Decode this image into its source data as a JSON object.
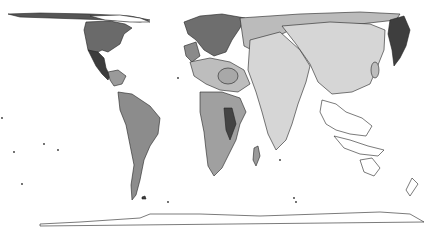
{
  "map": {
    "type": "cartogram",
    "style": "grayscale",
    "background": "#ffffff",
    "outline_color": "#222222",
    "shades": {
      "lightest": "#dcdcdc",
      "light": "#c4c4c4",
      "medium": "#a8a8a8",
      "mediumdark": "#8c8c8c",
      "dark": "#707070",
      "darkest": "#3c3c3c",
      "empty": "#ffffff"
    },
    "regions": [
      {
        "name": "north-america",
        "shade": "dark"
      },
      {
        "name": "mexico-central-america",
        "shade": "darkest"
      },
      {
        "name": "caribbean",
        "shade": "medium"
      },
      {
        "name": "south-america",
        "shade": "mediumdark"
      },
      {
        "name": "greenland-arctic",
        "shade": "darkest"
      },
      {
        "name": "europe",
        "shade": "dark"
      },
      {
        "name": "north-africa-middle-east",
        "shade": "light"
      },
      {
        "name": "sub-saharan-africa",
        "shade": "medium"
      },
      {
        "name": "russia-central-asia",
        "shade": "light"
      },
      {
        "name": "south-asia",
        "shade": "lightest"
      },
      {
        "name": "china",
        "shade": "lightest"
      },
      {
        "name": "japan-korea",
        "shade": "darkest"
      },
      {
        "name": "southeast-asia-oceania",
        "shade": "empty"
      },
      {
        "name": "antarctica",
        "shade": "empty"
      }
    ]
  }
}
